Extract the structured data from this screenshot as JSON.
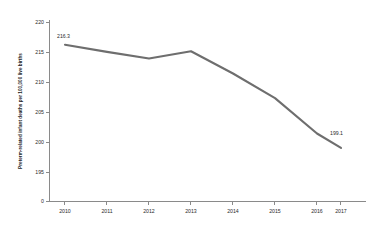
{
  "chart_data": {
    "type": "line",
    "title": "",
    "subtitle": "",
    "xlabel": "",
    "ylabel": "Preterm-related infant deaths per 100,000 live births",
    "categories": [
      "2010",
      "2011",
      "2012",
      "2013",
      "2014",
      "2015",
      "2016",
      "2017"
    ],
    "x": [
      2010,
      2011,
      2012,
      2013,
      2014,
      2015,
      2016,
      2017
    ],
    "values": [
      216.3,
      215.1,
      214.0,
      215.2,
      211.5,
      207.4,
      201.5,
      199.1
    ],
    "series": [
      {
        "name": "Preterm-related infant mortality rate",
        "values": [
          216.3,
          215.1,
          214.0,
          215.2,
          211.5,
          207.4,
          201.5,
          199.1
        ],
        "color": "#6e6e6e"
      }
    ],
    "y_ticks": [
      195,
      200,
      205,
      210,
      215,
      220
    ],
    "y_tick_labels": [
      "195",
      "200",
      "205",
      "210",
      "215",
      "220"
    ],
    "y_axis_break_label": "0",
    "ylim": [
      195,
      220
    ],
    "xlim": [
      2010,
      2017
    ],
    "grid": false,
    "legend": false,
    "legend_position": "none",
    "annotations": [
      {
        "text": "216.3",
        "x": 2010,
        "y": 216.3,
        "position": "above-right"
      },
      {
        "text": "199.1",
        "x": 2017,
        "y": 199.1,
        "position": "above-right"
      }
    ]
  },
  "colors": {
    "line": "#6e6e6e",
    "axis": "#8a8a8a",
    "text": "#2b2b2b",
    "background": "#ffffff"
  }
}
